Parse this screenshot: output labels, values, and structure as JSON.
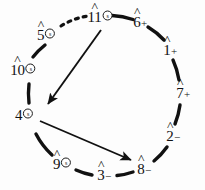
{
  "diagram": {
    "stroke_color": "#111111",
    "background_color": "#fdfdfd",
    "circle": {
      "center_x": 102,
      "center_y": 95,
      "radius_x": 72,
      "radius_y": 76
    },
    "nodes": [
      {
        "id": "n11",
        "degree": "11",
        "suffix": "circled-s",
        "hat": true,
        "x": 100,
        "y": 17
      },
      {
        "id": "n6",
        "degree": "6",
        "suffix": "+",
        "hat": true,
        "x": 140,
        "y": 22
      },
      {
        "id": "n1",
        "degree": "1",
        "suffix": "+",
        "hat": true,
        "x": 170,
        "y": 50
      },
      {
        "id": "n7",
        "degree": "7",
        "suffix": "+",
        "hat": true,
        "x": 183,
        "y": 93
      },
      {
        "id": "n2",
        "degree": "2",
        "suffix": "−",
        "hat": true,
        "x": 173,
        "y": 136
      },
      {
        "id": "n8",
        "degree": "8",
        "suffix": "−",
        "hat": true,
        "x": 144,
        "y": 169
      },
      {
        "id": "n3",
        "degree": "3",
        "suffix": "−",
        "hat": true,
        "x": 104,
        "y": 175
      },
      {
        "id": "n9",
        "degree": "9",
        "suffix": "circled-s",
        "hat": true,
        "x": 62,
        "y": 164
      },
      {
        "id": "n4",
        "degree": "4",
        "suffix": "circled-s",
        "hat": false,
        "x": 24,
        "y": 115
      },
      {
        "id": "n10",
        "degree": "10",
        "suffix": "circled-s",
        "hat": true,
        "x": 23,
        "y": 70
      },
      {
        "id": "n5",
        "degree": "5",
        "suffix": "circled-s",
        "hat": true,
        "x": 46,
        "y": 35
      }
    ],
    "arcs": [
      {
        "id": "arc-11-6",
        "from": "n11",
        "to": "n6",
        "style": "solid"
      },
      {
        "id": "arc-6-1",
        "from": "n6",
        "to": "n1",
        "style": "solid"
      },
      {
        "id": "arc-1-7",
        "from": "n1",
        "to": "n7",
        "style": "solid"
      },
      {
        "id": "arc-7-2",
        "from": "n7",
        "to": "n2",
        "style": "solid"
      },
      {
        "id": "arc-2-8",
        "from": "n2",
        "to": "n8",
        "style": "solid"
      },
      {
        "id": "arc-8-3",
        "from": "n8",
        "to": "n3",
        "style": "solid"
      },
      {
        "id": "arc-3-9",
        "from": "n3",
        "to": "n9",
        "style": "solid"
      },
      {
        "id": "arc-9-4",
        "from": "n9",
        "to": "n4",
        "style": "solid"
      },
      {
        "id": "arc-4-10",
        "from": "n4",
        "to": "n10",
        "style": "solid"
      },
      {
        "id": "arc-10-5",
        "from": "n10",
        "to": "n5",
        "style": "solid"
      },
      {
        "id": "arc-5-11",
        "from": "n5",
        "to": "n11",
        "style": "dashed"
      }
    ],
    "arrows": [
      {
        "id": "arrow-11-to-4",
        "from": "n11",
        "to": "n4",
        "style": "solid"
      },
      {
        "id": "arrow-4-to-8",
        "from": "n4",
        "to": "n8",
        "style": "solid"
      }
    ]
  }
}
